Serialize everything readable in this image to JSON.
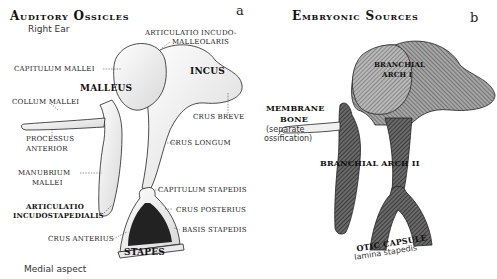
{
  "panel_a": {
    "letter": "a",
    "title": "Auditory Ossicles",
    "subtitle": "Right Ear",
    "footer": "Medial aspect",
    "labels": {
      "articulatio_incudomalleolaris_1": "ARTICULATIO INCUDO-",
      "articulatio_incudomalleolaris_2": "MALLEOLARIS",
      "capitulum_mallei": "CAPITULUM MALLEI",
      "incus": "INCUS",
      "malleus": "MALLEUS",
      "collum_mallei": "COLLUM MALLEI",
      "crus_breve": "CRUS BREVE",
      "processus_anterior_1": "PROCESSUS",
      "processus_anterior_2": "ANTERIOR",
      "crus_longum": "CRUS LONGUM",
      "manubrium_mallei_1": "MANUBRIUM",
      "manubrium_mallei_2": "MALLEI",
      "capitulum_stapedis": "CAPITULUM STAPEDIS",
      "articulatio_incudostapedialis_1": "ARTICULATIO",
      "articulatio_incudostapedialis_2": "INCUDOSTAPEDIALIS",
      "crus_posterius": "CRUS POSTERIUS",
      "basis_stapedis": "BASIS STAPEDIS",
      "crus_anterius": "CRUS ANTERIUS",
      "stapes": "STAPES"
    }
  },
  "panel_b": {
    "letter": "b",
    "title": "Embryonic Sources",
    "labels": {
      "branchial_arch_1_line1": "BRANCHIAL",
      "branchial_arch_1_line2": "ARCH I",
      "membrane_bone_1": "MEMBRANE",
      "membrane_bone_2": "BONE",
      "separate_ossification_1": "(separate",
      "separate_ossification_2": "ossification)",
      "branchial_arch_2": "BRANCHIAL ARCH II",
      "otic_capsule": "OTIC CAPSULE",
      "lamina_stapedis": "lamina stapedis"
    }
  },
  "colors": {
    "ink": "#1a1a1a",
    "arch1_fill": "#9a9a9a",
    "arch2_fill": "#555555",
    "bone_fill": "#f2f2f2"
  }
}
